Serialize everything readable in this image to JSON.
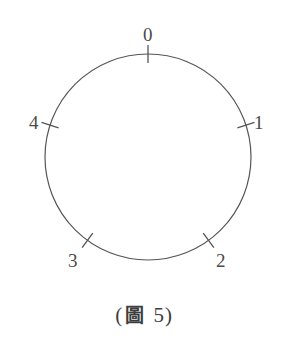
{
  "figure": {
    "caption_open_paren": "(",
    "caption_cjk": "圖",
    "caption_number": "5",
    "caption_close_paren": ")",
    "caption_full": "(圖 5)",
    "stroke_color": "#555555",
    "label_color": "#4a4a4a",
    "background_color": "#ffffff",
    "circle": {
      "center_x": 148,
      "center_y": 157,
      "radius": 103,
      "stroke_width": 1.2
    },
    "ticks": [
      {
        "label": "0",
        "angle_deg": 0,
        "label_x": 143,
        "label_y": 25
      },
      {
        "label": "1",
        "angle_deg": 72,
        "label_x": 254,
        "label_y": 113
      },
      {
        "label": "2",
        "angle_deg": 144,
        "label_x": 216,
        "label_y": 251
      },
      {
        "label": "3",
        "angle_deg": 216,
        "label_x": 68,
        "label_y": 251
      },
      {
        "label": "4",
        "angle_deg": 288,
        "label_x": 29,
        "label_y": 113
      }
    ]
  },
  "chart_data": {
    "type": "scatter",
    "title": "(圖 5)",
    "xlabel": "",
    "ylabel": "",
    "categories": [
      "0",
      "1",
      "2",
      "3",
      "4"
    ],
    "values": [
      0,
      72,
      144,
      216,
      288
    ],
    "units": "degrees clockwise from top",
    "grid": false,
    "legend": "none"
  }
}
